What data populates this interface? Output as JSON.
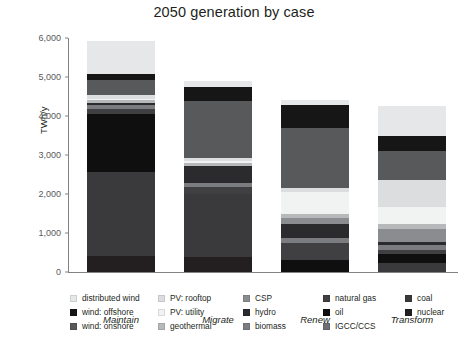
{
  "chart_data": {
    "type": "bar",
    "stacked": true,
    "title": "2050 generation by case",
    "xlabel": "",
    "ylabel": "TWh/y",
    "ylim": [
      0,
      6000
    ],
    "yticks": [
      0,
      1000,
      2000,
      3000,
      4000,
      5000,
      6000
    ],
    "ytick_labels": [
      "0",
      "1,000",
      "2,000",
      "3,000",
      "4,000",
      "5,000",
      "6,000"
    ],
    "grid": false,
    "legend_position": "bottom",
    "categories": [
      "Maintain",
      "Migrate",
      "Renew",
      "Transform"
    ],
    "series": [
      {
        "name": "nuclear",
        "color": "#231f20",
        "values": [
          420,
          380,
          0,
          0
        ]
      },
      {
        "name": "coal",
        "color": "#3a3a3c",
        "values": [
          2150,
          1620,
          0,
          220
        ]
      },
      {
        "name": "IGCC/CCS",
        "color": "#6d6e71",
        "values": [
          0,
          0,
          0,
          0
        ]
      },
      {
        "name": "oil",
        "color": "#0f0f10",
        "values": [
          1480,
          0,
          320,
          250
        ]
      },
      {
        "name": "natural gas",
        "color": "#404042",
        "values": [
          140,
          180,
          430,
          90
        ]
      },
      {
        "name": "biomass",
        "color": "#7a7c7f",
        "values": [
          90,
          110,
          120,
          130
        ]
      },
      {
        "name": "hydro",
        "color": "#2b2b2d",
        "values": [
          60,
          430,
          370,
          80
        ]
      },
      {
        "name": "CSP",
        "color": "#8a8c8f",
        "values": [
          0,
          0,
          150,
          330
        ]
      },
      {
        "name": "geothermal",
        "color": "#b6b8ba",
        "values": [
          60,
          70,
          110,
          140
        ]
      },
      {
        "name": "PV: utility",
        "color": "#f1f2f2",
        "values": [
          50,
          60,
          560,
          420
        ]
      },
      {
        "name": "PV: rooftop",
        "color": "#dcdddf",
        "values": [
          80,
          70,
          100,
          700
        ]
      },
      {
        "name": "wind: onshore",
        "color": "#58595b",
        "values": [
          390,
          1460,
          1530,
          740
        ]
      },
      {
        "name": "wind: offshore",
        "color": "#161617",
        "values": [
          160,
          360,
          600,
          400
        ]
      },
      {
        "name": "distributed wind",
        "color": "#e6e7e8",
        "values": [
          840,
          170,
          120,
          760
        ]
      }
    ],
    "totals": [
      5920,
      4910,
      4410,
      4260
    ]
  },
  "legend": {
    "columns": [
      {
        "items": [
          {
            "label": "distributed wind",
            "color": "#e6e7e8"
          },
          {
            "label": "wind: offshore",
            "color": "#161617"
          },
          {
            "label": "wind: onshore",
            "color": "#58595b"
          }
        ]
      },
      {
        "items": [
          {
            "label": "PV: rooftop",
            "color": "#dcdddf"
          },
          {
            "label": "PV: utility",
            "color": "#f1f2f2"
          },
          {
            "label": "geothermal",
            "color": "#b6b8ba"
          }
        ]
      },
      {
        "items": [
          {
            "label": "CSP",
            "color": "#8a8c8f"
          },
          {
            "label": "hydro",
            "color": "#2b2b2d"
          },
          {
            "label": "biomass",
            "color": "#7a7c7f"
          }
        ]
      },
      {
        "items": [
          {
            "label": "natural gas",
            "color": "#404042"
          },
          {
            "label": "oil",
            "color": "#0f0f10"
          },
          {
            "label": "IGCC/CCS",
            "color": "#6d6e71"
          }
        ]
      },
      {
        "items": [
          {
            "label": "coal",
            "color": "#3a3a3c"
          },
          {
            "label": "nuclear",
            "color": "#231f20"
          }
        ]
      }
    ]
  }
}
